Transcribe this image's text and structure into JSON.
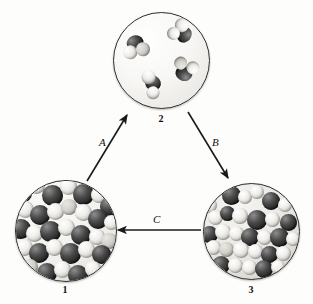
{
  "figure": {
    "type": "states-of-matter-cycle",
    "background_color": "#fdfdfc",
    "scan_artifact_text": "· · · · · · · · · · · · · ·"
  },
  "panels": [
    {
      "id": "solid",
      "label": "1",
      "name": "panel-solid",
      "state": "solid",
      "description": "Ordered hexagonal lattice of space-filling molecules",
      "cx": 65,
      "cy": 230,
      "r": 50,
      "label_x": 55,
      "label_y": 284
    },
    {
      "id": "gas",
      "label": "2",
      "name": "panel-gas",
      "state": "gas",
      "description": "Four widely separated bent triatomic molecules",
      "cx": 160.5,
      "cy": 59.5,
      "r": 47.5,
      "label_x": 151,
      "label_y": 113
    },
    {
      "id": "liquid",
      "label": "3",
      "name": "panel-liquid",
      "state": "liquid",
      "description": "Densely packed disordered molecules",
      "cx": 250.5,
      "cy": 230.5,
      "r": 47.5,
      "label_x": 241,
      "label_y": 284
    }
  ],
  "arrows": [
    {
      "id": "A",
      "label": "A",
      "from": "1",
      "to": "2",
      "x1": 87,
      "y1": 181,
      "x2": 127,
      "y2": 115,
      "label_x": 99,
      "label_y": 136,
      "color": "#1a1a1a"
    },
    {
      "id": "B",
      "label": "B",
      "from": "2",
      "to": "3",
      "x1": 188,
      "y1": 112,
      "x2": 228,
      "y2": 178,
      "label_x": 212,
      "label_y": 136,
      "color": "#1a1a1a"
    },
    {
      "id": "C",
      "label": "C",
      "from": "3",
      "to": "1",
      "x1": 201,
      "y1": 230,
      "x2": 118,
      "y2": 230,
      "label_x": 153,
      "label_y": 213,
      "color": "#1a1a1a"
    }
  ],
  "gas_molecules": [
    {
      "name": "gas-molecule-1",
      "x": 8,
      "y": 22,
      "rot": -18
    },
    {
      "name": "gas-molecule-2",
      "x": 51,
      "y": 6,
      "rot": 128
    },
    {
      "name": "gas-molecule-3",
      "x": 57,
      "y": 42,
      "rot": 196
    },
    {
      "name": "gas-molecule-4",
      "x": 23,
      "y": 60,
      "rot": 34
    }
  ],
  "colors": {
    "atom_dark": "#242424",
    "atom_light": "#f0efec",
    "atom_mid": "#d2d0ca",
    "outline": "#2c2c2c",
    "text": "#101010"
  }
}
